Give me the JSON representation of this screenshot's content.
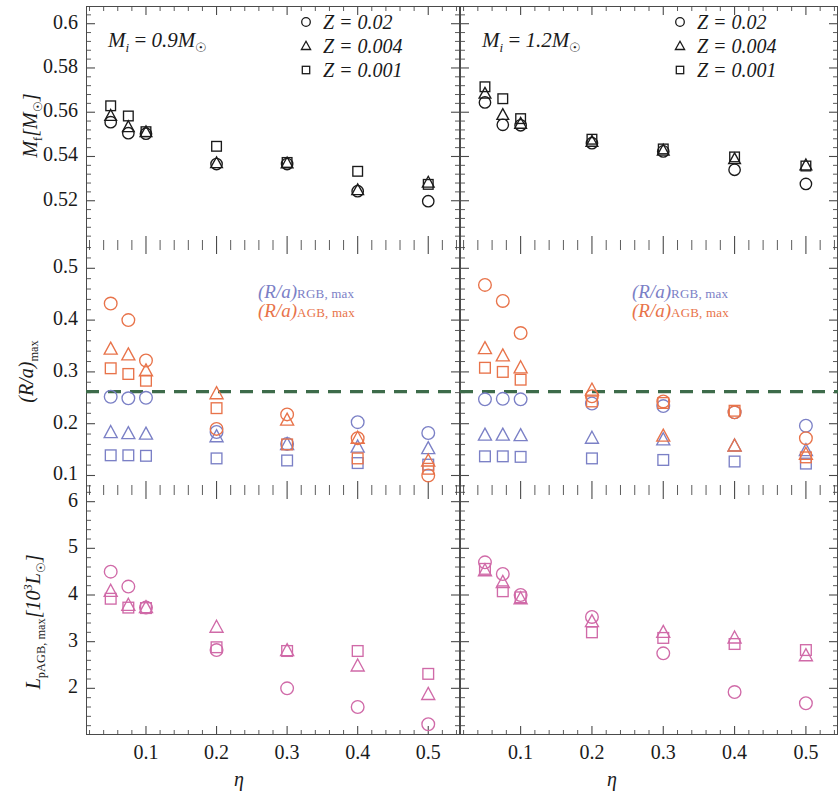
{
  "figure": {
    "width": 838,
    "height": 799,
    "colors": {
      "rgb": "#7b80c6",
      "agb": "#e8734a",
      "pagb": "#d06aa8",
      "black": "#1a1a1a",
      "dashed_line": "#3d6b4a",
      "axis": "#4a4a4a"
    },
    "xaxis": {
      "label": "η",
      "ticks": [
        0.1,
        0.2,
        0.3,
        0.4,
        0.5
      ],
      "tick_labels": [
        "0.1",
        "0.2",
        "0.3",
        "0.4",
        "0.5"
      ],
      "lim": [
        0.015,
        0.545
      ]
    },
    "columns": [
      {
        "key": "left",
        "title_mi": "M",
        "title_sub": "i",
        "title_val": "= 0.9",
        "title_msun": "M☉"
      },
      {
        "key": "right",
        "title_mi": "M",
        "title_sub": "i",
        "title_val": "= 1.2",
        "title_msun": "M☉"
      }
    ],
    "marker_legend": {
      "entries": [
        {
          "shape": "circle",
          "label": "Z = 0.02"
        },
        {
          "shape": "triangle",
          "label": "Z = 0.004"
        },
        {
          "shape": "square",
          "label": "Z = 0.001"
        }
      ]
    },
    "ra_legend": {
      "line1_main": "(R/a)",
      "line1_sub": "RGB, max",
      "line2_main": "(R/a)",
      "line2_sub": "AGB, max"
    }
  },
  "chart_data": [
    {
      "id": "mf-09",
      "type": "scatter",
      "panel": "top-left",
      "title": "M_i = 0.9 M_sun",
      "xlabel": "η",
      "ylabel": "M_f [M_sun]",
      "ylim": [
        0.5,
        0.608
      ],
      "yticks": [
        0.52,
        0.54,
        0.56,
        0.58,
        0.6
      ],
      "ytick_labels": [
        "0.52",
        "0.54",
        "0.56",
        "0.58",
        "0.6"
      ],
      "xlim": [
        0.015,
        0.545
      ],
      "grid": false,
      "series": [
        {
          "name": "Z = 0.02",
          "marker": "circle",
          "color": "#1a1a1a",
          "x": [
            0.05,
            0.075,
            0.1,
            0.2,
            0.3,
            0.4,
            0.5
          ],
          "y": [
            0.5555,
            0.5505,
            0.5503,
            0.5366,
            0.5366,
            0.5243,
            0.5198
          ]
        },
        {
          "name": "Z = 0.004",
          "marker": "triangle",
          "color": "#1a1a1a",
          "x": [
            0.05,
            0.075,
            0.1,
            0.2,
            0.3,
            0.4,
            0.5
          ],
          "y": [
            0.5584,
            0.5533,
            0.551,
            0.537,
            0.5369,
            0.5248,
            0.5282
          ]
        },
        {
          "name": "Z = 0.001",
          "marker": "square",
          "color": "#1a1a1a",
          "x": [
            0.05,
            0.075,
            0.1,
            0.2,
            0.3,
            0.4,
            0.5
          ],
          "y": [
            0.5629,
            0.5583,
            0.5512,
            0.5446,
            0.5373,
            0.5333,
            0.5274
          ]
        }
      ]
    },
    {
      "id": "mf-12",
      "type": "scatter",
      "panel": "top-right",
      "title": "M_i = 1.2 M_sun",
      "xlabel": "η",
      "ylabel": "M_f [M_sun]",
      "ylim": [
        0.5,
        0.608
      ],
      "yticks": [
        0.52,
        0.54,
        0.56,
        0.58,
        0.6
      ],
      "xlim": [
        0.015,
        0.545
      ],
      "grid": false,
      "series": [
        {
          "name": "Z = 0.02",
          "marker": "circle",
          "color": "#1a1a1a",
          "x": [
            0.05,
            0.075,
            0.1,
            0.2,
            0.3,
            0.4,
            0.5
          ],
          "y": [
            0.5644,
            0.5543,
            0.5541,
            0.546,
            0.5423,
            0.534,
            0.5276
          ]
        },
        {
          "name": "Z = 0.004",
          "marker": "triangle",
          "color": "#1a1a1a",
          "x": [
            0.05,
            0.075,
            0.1,
            0.2,
            0.3,
            0.4,
            0.5
          ],
          "y": [
            0.5684,
            0.5588,
            0.5548,
            0.5467,
            0.5427,
            0.5388,
            0.536
          ]
        },
        {
          "name": "Z = 0.001",
          "marker": "square",
          "color": "#1a1a1a",
          "x": [
            0.05,
            0.075,
            0.1,
            0.2,
            0.3,
            0.4,
            0.5
          ],
          "y": [
            0.5715,
            0.5661,
            0.5571,
            0.5478,
            0.5434,
            0.5398,
            0.5357
          ]
        }
      ]
    },
    {
      "id": "ra-09",
      "type": "scatter",
      "panel": "middle-left",
      "xlabel": "η",
      "ylabel": "(R/a)_max",
      "ylim": [
        0.072,
        0.545
      ],
      "yticks": [
        0.1,
        0.2,
        0.3,
        0.4,
        0.5
      ],
      "ytick_labels": [
        "0.1",
        "0.2",
        "0.3",
        "0.4",
        "0.5"
      ],
      "xlim": [
        0.015,
        0.545
      ],
      "hline": {
        "value": 0.262,
        "style": "dashed",
        "color": "#3d6b4a"
      },
      "series": [
        {
          "name": "(R/a) RGB,max  Z = 0.02",
          "marker": "circle",
          "color": "#7b80c6",
          "x": [
            0.05,
            0.075,
            0.1,
            0.2,
            0.3,
            0.4,
            0.5
          ],
          "y": [
            0.252,
            0.249,
            0.25,
            0.184,
            0.161,
            0.203,
            0.182
          ]
        },
        {
          "name": "(R/a) RGB,max  Z = 0.004",
          "marker": "triangle",
          "color": "#7b80c6",
          "x": [
            0.05,
            0.075,
            0.1,
            0.2,
            0.3,
            0.4,
            0.5
          ],
          "y": [
            0.183,
            0.181,
            0.18,
            0.175,
            0.16,
            0.155,
            0.152
          ]
        },
        {
          "name": "(R/a) RGB,max  Z = 0.001",
          "marker": "square",
          "color": "#7b80c6",
          "x": [
            0.05,
            0.075,
            0.1,
            0.2,
            0.3,
            0.4,
            0.5
          ],
          "y": [
            0.139,
            0.139,
            0.138,
            0.133,
            0.129,
            0.124,
            0.121
          ]
        },
        {
          "name": "(R/a) AGB,max  Z = 0.02",
          "marker": "circle",
          "color": "#e8734a",
          "x": [
            0.05,
            0.075,
            0.1,
            0.2,
            0.3,
            0.4,
            0.5
          ],
          "y": [
            0.432,
            0.4,
            0.322,
            0.19,
            0.218,
            0.172,
            0.1
          ]
        },
        {
          "name": "(R/a) AGB,max  Z = 0.004",
          "marker": "triangle",
          "color": "#e8734a",
          "x": [
            0.05,
            0.075,
            0.1,
            0.2,
            0.3,
            0.4,
            0.5
          ],
          "y": [
            0.344,
            0.333,
            0.302,
            0.258,
            0.207,
            0.172,
            0.128
          ]
        },
        {
          "name": "(R/a) AGB,max  Z = 0.001",
          "marker": "square",
          "color": "#e8734a",
          "x": [
            0.05,
            0.075,
            0.1,
            0.2,
            0.3,
            0.4,
            0.5
          ],
          "y": [
            0.307,
            0.296,
            0.283,
            0.23,
            0.16,
            0.133,
            0.113
          ]
        }
      ]
    },
    {
      "id": "ra-12",
      "type": "scatter",
      "panel": "middle-right",
      "xlabel": "η",
      "ylabel": "(R/a)_max",
      "ylim": [
        0.072,
        0.545
      ],
      "yticks": [
        0.1,
        0.2,
        0.3,
        0.4,
        0.5
      ],
      "xlim": [
        0.015,
        0.545
      ],
      "hline": {
        "value": 0.262,
        "style": "dashed",
        "color": "#3d6b4a"
      },
      "series": [
        {
          "name": "(R/a) RGB,max  Z = 0.02",
          "marker": "circle",
          "color": "#7b80c6",
          "x": [
            0.05,
            0.075,
            0.1,
            0.2,
            0.3,
            0.4,
            0.5
          ],
          "y": [
            0.247,
            0.248,
            0.247,
            0.239,
            0.234,
            0.222,
            0.196
          ]
        },
        {
          "name": "(R/a) RGB,max  Z = 0.004",
          "marker": "triangle",
          "color": "#7b80c6",
          "x": [
            0.05,
            0.075,
            0.1,
            0.2,
            0.3,
            0.4,
            0.5
          ],
          "y": [
            0.178,
            0.178,
            0.177,
            0.172,
            0.169,
            0.157,
            0.148
          ]
        },
        {
          "name": "(R/a) RGB,max  Z = 0.001",
          "marker": "square",
          "color": "#7b80c6",
          "x": [
            0.05,
            0.075,
            0.1,
            0.2,
            0.3,
            0.4,
            0.5
          ],
          "y": [
            0.137,
            0.137,
            0.136,
            0.133,
            0.13,
            0.127,
            0.123
          ]
        },
        {
          "name": "(R/a) AGB,max  Z = 0.02",
          "marker": "circle",
          "color": "#e8734a",
          "x": [
            0.05,
            0.075,
            0.1,
            0.2,
            0.3,
            0.4,
            0.5
          ],
          "y": [
            0.468,
            0.437,
            0.375,
            0.253,
            0.243,
            0.222,
            0.172
          ]
        },
        {
          "name": "(R/a) AGB,max  Z = 0.004",
          "marker": "triangle",
          "color": "#e8734a",
          "x": [
            0.05,
            0.075,
            0.1,
            0.2,
            0.3,
            0.4,
            0.5
          ],
          "y": [
            0.345,
            0.331,
            0.308,
            0.265,
            0.176,
            0.157,
            0.141
          ]
        },
        {
          "name": "(R/a) AGB,max  Z = 0.001",
          "marker": "square",
          "color": "#e8734a",
          "x": [
            0.05,
            0.075,
            0.1,
            0.2,
            0.3,
            0.4,
            0.5
          ],
          "y": [
            0.308,
            0.3,
            0.285,
            0.243,
            0.24,
            0.225,
            0.135
          ]
        }
      ]
    },
    {
      "id": "lpagb-09",
      "type": "scatter",
      "panel": "bottom-left",
      "xlabel": "η",
      "ylabel": "L_pAGB,max [10^3 L_sun]",
      "ylim": [
        1.0,
        6.25
      ],
      "yticks": [
        1,
        2,
        3,
        4,
        5,
        6
      ],
      "ytick_labels": [
        "1",
        "2",
        "3",
        "4",
        "5",
        "6"
      ],
      "xlim": [
        0.015,
        0.545
      ],
      "series": [
        {
          "name": "Z = 0.02",
          "marker": "circle",
          "color": "#d06aa8",
          "x": [
            0.05,
            0.075,
            0.1,
            0.2,
            0.3,
            0.4,
            0.5
          ],
          "y": [
            4.5,
            4.18,
            3.73,
            2.82,
            2.0,
            1.6,
            1.23
          ]
        },
        {
          "name": "Z = 0.004",
          "marker": "triangle",
          "color": "#d06aa8",
          "x": [
            0.05,
            0.075,
            0.1,
            0.2,
            0.3,
            0.4,
            0.5
          ],
          "y": [
            4.08,
            3.78,
            3.73,
            3.31,
            2.81,
            2.48,
            1.87
          ]
        },
        {
          "name": "Z = 0.001",
          "marker": "square",
          "color": "#d06aa8",
          "x": [
            0.05,
            0.075,
            0.1,
            0.2,
            0.3,
            0.4,
            0.5
          ],
          "y": [
            3.92,
            3.73,
            3.72,
            2.88,
            2.8,
            2.8,
            2.31
          ]
        }
      ]
    },
    {
      "id": "lpagb-12",
      "type": "scatter",
      "panel": "bottom-right",
      "xlabel": "η",
      "ylabel": "L_pAGB,max [10^3 L_sun]",
      "ylim": [
        1.0,
        6.25
      ],
      "yticks": [
        1,
        2,
        3,
        4,
        5,
        6
      ],
      "xlim": [
        0.015,
        0.545
      ],
      "series": [
        {
          "name": "Z = 0.02",
          "marker": "circle",
          "color": "#d06aa8",
          "x": [
            0.05,
            0.075,
            0.1,
            0.2,
            0.3,
            0.4,
            0.5
          ],
          "y": [
            4.7,
            4.45,
            4.0,
            3.53,
            2.75,
            1.92,
            1.68
          ]
        },
        {
          "name": "Z = 0.004",
          "marker": "triangle",
          "color": "#d06aa8",
          "x": [
            0.05,
            0.075,
            0.1,
            0.2,
            0.3,
            0.4,
            0.5
          ],
          "y": [
            4.52,
            4.27,
            3.92,
            3.43,
            3.2,
            3.08,
            2.7
          ]
        },
        {
          "name": "Z = 0.001",
          "marker": "square",
          "color": "#d06aa8",
          "x": [
            0.05,
            0.075,
            0.1,
            0.2,
            0.3,
            0.4,
            0.5
          ],
          "y": [
            4.56,
            4.08,
            3.95,
            3.2,
            3.08,
            2.95,
            2.82
          ]
        }
      ]
    }
  ]
}
